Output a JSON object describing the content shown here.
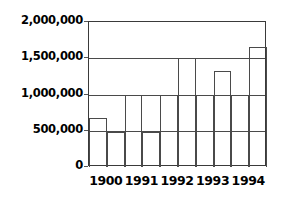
{
  "chart_data": {
    "type": "bar",
    "title": "",
    "subtitle": "",
    "xlabel": "",
    "ylabel": "",
    "categories": [
      "1900",
      "1991",
      "1992",
      "1993",
      "1994"
    ],
    "ylim": [
      0,
      2000000
    ],
    "ytick_values": [
      0,
      500000,
      1000000,
      1500000,
      2000000
    ],
    "ytick_labels": [
      "0",
      "500,000",
      "1,000,000",
      "1,500,000",
      "2,000,000"
    ],
    "grid": "horizontal",
    "legend": "none",
    "bar_style": "outline",
    "series": [
      {
        "name": "series-1",
        "values": [
          670000,
          1000000,
          1000000,
          1000000,
          1000000
        ]
      },
      {
        "name": "series-2",
        "values": [
          480000,
          480000,
          1500000,
          1330000,
          1660000
        ]
      }
    ]
  },
  "axes": {
    "y_axis_name": "y-axis",
    "x_axis_name": "x-axis"
  }
}
